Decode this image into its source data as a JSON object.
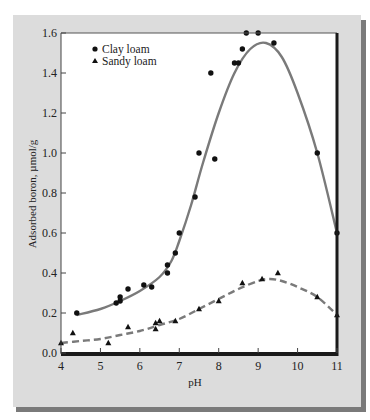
{
  "chart_data": {
    "type": "scatter",
    "title": "",
    "xlabel": "pH",
    "ylabel": "Adsorbed boron, µmol/g",
    "xlim": [
      4,
      11
    ],
    "ylim": [
      0.0,
      1.6
    ],
    "xticks": [
      "4",
      "5",
      "6",
      "7",
      "8",
      "9",
      "10",
      "11"
    ],
    "yticks": [
      "0.0",
      "0.2",
      "0.4",
      "0.6",
      "0.8",
      "1.0",
      "1.2",
      "1.4",
      "1.6"
    ],
    "grid": false,
    "legend_position": "upper left",
    "series": [
      {
        "name": "Clay loam",
        "marker": "circle",
        "fit_line": "solid",
        "color": "#111111",
        "line_color": "#7a7a7a",
        "points": [
          [
            4.4,
            0.2
          ],
          [
            5.4,
            0.25
          ],
          [
            5.5,
            0.26
          ],
          [
            5.5,
            0.28
          ],
          [
            5.7,
            0.32
          ],
          [
            6.1,
            0.34
          ],
          [
            6.3,
            0.33
          ],
          [
            6.7,
            0.4
          ],
          [
            6.7,
            0.44
          ],
          [
            6.9,
            0.5
          ],
          [
            7.0,
            0.6
          ],
          [
            7.4,
            0.78
          ],
          [
            7.5,
            1.0
          ],
          [
            7.9,
            0.97
          ],
          [
            7.8,
            1.4
          ],
          [
            8.4,
            1.45
          ],
          [
            8.5,
            1.45
          ],
          [
            8.6,
            1.52
          ],
          [
            8.7,
            1.6
          ],
          [
            9.0,
            1.6
          ],
          [
            9.4,
            1.55
          ],
          [
            10.5,
            1.0
          ],
          [
            11.0,
            0.6
          ]
        ],
        "fit": [
          [
            4.4,
            0.19
          ],
          [
            5.0,
            0.22
          ],
          [
            5.5,
            0.26
          ],
          [
            6.0,
            0.31
          ],
          [
            6.5,
            0.38
          ],
          [
            6.8,
            0.46
          ],
          [
            7.0,
            0.56
          ],
          [
            7.3,
            0.74
          ],
          [
            7.6,
            0.95
          ],
          [
            8.0,
            1.2
          ],
          [
            8.4,
            1.4
          ],
          [
            8.8,
            1.52
          ],
          [
            9.2,
            1.55
          ],
          [
            9.6,
            1.48
          ],
          [
            10.0,
            1.3
          ],
          [
            10.5,
            1.0
          ],
          [
            11.0,
            0.6
          ]
        ]
      },
      {
        "name": "Sandy loam",
        "marker": "triangle",
        "fit_line": "dashed",
        "color": "#111111",
        "line_color": "#7a7a7a",
        "points": [
          [
            4.0,
            0.05
          ],
          [
            4.3,
            0.1
          ],
          [
            5.2,
            0.05
          ],
          [
            5.7,
            0.13
          ],
          [
            6.4,
            0.12
          ],
          [
            6.4,
            0.15
          ],
          [
            6.5,
            0.16
          ],
          [
            6.9,
            0.16
          ],
          [
            7.5,
            0.22
          ],
          [
            8.0,
            0.26
          ],
          [
            8.6,
            0.35
          ],
          [
            9.1,
            0.37
          ],
          [
            9.5,
            0.4
          ],
          [
            10.5,
            0.28
          ],
          [
            11.0,
            0.19
          ]
        ],
        "fit": [
          [
            4.0,
            0.05
          ],
          [
            4.5,
            0.06
          ],
          [
            5.0,
            0.07
          ],
          [
            5.5,
            0.09
          ],
          [
            6.0,
            0.11
          ],
          [
            6.5,
            0.14
          ],
          [
            7.0,
            0.17
          ],
          [
            7.5,
            0.22
          ],
          [
            8.0,
            0.27
          ],
          [
            8.5,
            0.32
          ],
          [
            9.0,
            0.36
          ],
          [
            9.3,
            0.37
          ],
          [
            9.6,
            0.36
          ],
          [
            10.0,
            0.33
          ],
          [
            10.5,
            0.28
          ],
          [
            11.0,
            0.19
          ]
        ]
      }
    ]
  },
  "legend": {
    "items": [
      {
        "label": "Clay loam",
        "marker": "circle"
      },
      {
        "label": "Sandy loam",
        "marker": "triangle"
      }
    ]
  },
  "axes": {
    "x_title": "pH",
    "y_title": "Adsorbed boron, µmol/g"
  },
  "colors": {
    "frame": "#dcdcdc",
    "frame_shadow": "#7a7a7a",
    "plot_bg": "#ffffff",
    "axis": "#1a1a1a",
    "curve": "#7a7a7a",
    "marker": "#111111"
  }
}
